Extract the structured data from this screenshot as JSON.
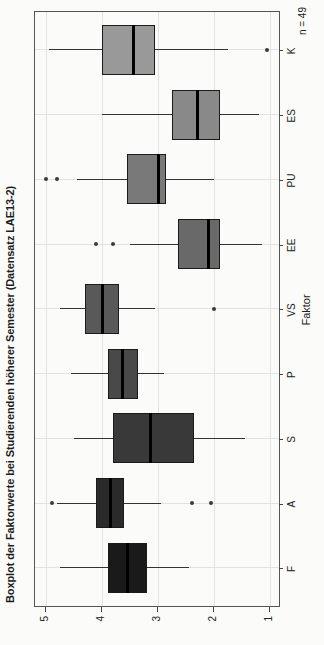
{
  "title": "Boxplot der Faktorwerte bei Studierenden höherer Semester (Datensatz LAE13-2)",
  "annotation": "n = 49",
  "axes": {
    "x_label": "Faktor",
    "value_ticks": [
      1,
      2,
      3,
      4,
      5
    ],
    "value_range": [
      1,
      5
    ],
    "grid": "on"
  },
  "colors": {
    "frame": "#555555",
    "grid": "#e2e2e0",
    "ink": "#333333",
    "median": "#000000",
    "background": "#fbfbf9"
  },
  "chart_data": {
    "type": "boxplot",
    "note": "vertical boxplots on a 1-5 scale; whole figure rotated 90 degrees counterclockwise",
    "title": "Boxplot der Faktorwerte bei Studierenden höherer Semester (Datensatz LAE13-2)",
    "xlabel": "Faktor",
    "ylim": [
      1,
      5
    ],
    "categories": [
      "F",
      "A",
      "S",
      "P",
      "VS",
      "EE",
      "PU",
      "ES",
      "K"
    ],
    "series": [
      {
        "name": "F",
        "low": 2.45,
        "q1": 3.2,
        "median": 3.55,
        "q3": 3.9,
        "high": 4.75,
        "outliers": [],
        "color": "#1a1a1a"
      },
      {
        "name": "A",
        "low": 2.95,
        "q1": 3.6,
        "median": 3.85,
        "q3": 4.1,
        "high": 4.8,
        "outliers": [
          4.9,
          2.4,
          2.05
        ],
        "color": "#2a2a2a"
      },
      {
        "name": "S",
        "low": 1.45,
        "q1": 2.35,
        "median": 3.15,
        "q3": 3.8,
        "high": 4.5,
        "outliers": [],
        "color": "#393939"
      },
      {
        "name": "P",
        "low": 2.9,
        "q1": 3.35,
        "median": 3.65,
        "q3": 3.9,
        "high": 4.55,
        "outliers": [],
        "color": "#494949"
      },
      {
        "name": "VS",
        "low": 3.05,
        "q1": 3.7,
        "median": 4.0,
        "q3": 4.3,
        "high": 4.75,
        "outliers": [
          2.0
        ],
        "color": "#595959"
      },
      {
        "name": "EE",
        "low": 1.15,
        "q1": 1.9,
        "median": 2.1,
        "q3": 2.65,
        "high": 3.5,
        "outliers": [
          3.8,
          4.1
        ],
        "color": "#696969"
      },
      {
        "name": "PU",
        "low": 2.0,
        "q1": 2.85,
        "median": 3.0,
        "q3": 3.55,
        "high": 4.45,
        "outliers": [
          4.8,
          5.0
        ],
        "color": "#797979"
      },
      {
        "name": "ES",
        "low": 1.2,
        "q1": 1.9,
        "median": 2.3,
        "q3": 2.75,
        "high": 4.0,
        "outliers": [],
        "color": "#898989"
      },
      {
        "name": "K",
        "low": 1.75,
        "q1": 3.05,
        "median": 3.45,
        "q3": 4.0,
        "high": 4.95,
        "outliers": [
          1.05
        ],
        "color": "#999999"
      }
    ]
  }
}
